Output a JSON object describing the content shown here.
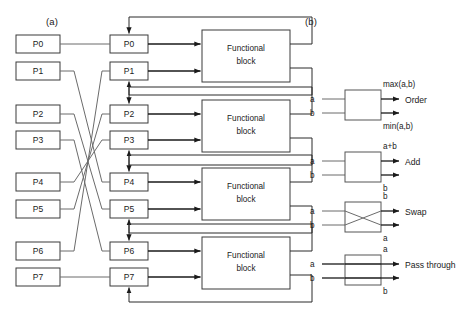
{
  "figure": {
    "panel_a": {
      "label": "(a)",
      "input_registers": [
        "P0",
        "P1",
        "P2",
        "P3",
        "P4",
        "P5",
        "P6",
        "P7"
      ],
      "stage_registers": [
        "P0",
        "P1",
        "P2",
        "P3",
        "P4",
        "P5",
        "P6",
        "P7"
      ],
      "functional_blocks": [
        {
          "line1": "Functional",
          "line2": "block"
        },
        {
          "line1": "Functional",
          "line2": "block"
        },
        {
          "line1": "Functional",
          "line2": "block"
        },
        {
          "line1": "Functional",
          "line2": "block"
        }
      ],
      "permutation": [
        {
          "from": "P0",
          "to": "P0"
        },
        {
          "from": "P1",
          "to": "P4"
        },
        {
          "from": "P2",
          "to": "P5"
        },
        {
          "from": "P3",
          "to": "P6"
        },
        {
          "from": "P4",
          "to": "P3"
        },
        {
          "from": "P5",
          "to": "P2"
        },
        {
          "from": "P6",
          "to": "P1"
        },
        {
          "from": "P7",
          "to": "P7"
        }
      ]
    },
    "panel_b": {
      "label": "(b)",
      "operations": [
        {
          "name": "Order",
          "inputs": [
            "a",
            "b"
          ],
          "output_top": "max(a,b)",
          "output_bottom": "min(a,b)",
          "style": "plain"
        },
        {
          "name": "Add",
          "inputs": [
            "a",
            "b"
          ],
          "output_top": "a+b",
          "output_bottom": "b",
          "style": "plain"
        },
        {
          "name": "Swap",
          "inputs": [
            "a",
            "b"
          ],
          "output_top": "b",
          "output_bottom": "a",
          "style": "cross"
        },
        {
          "name": "Pass through",
          "inputs": [
            "a",
            "b"
          ],
          "output_top": "a",
          "output_bottom": "b",
          "style": "straight"
        }
      ]
    }
  },
  "colors": {
    "background": "#ffffff",
    "ink": "#1a1a1a",
    "wire": "#6b6b6b",
    "box_stroke": "#3a3a3a"
  }
}
